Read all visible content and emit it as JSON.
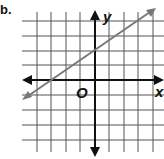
{
  "problem": {
    "number_label": "b."
  },
  "graph": {
    "x_axis_label": "x",
    "y_axis_label": "y",
    "origin_label": "O",
    "grid": {
      "x_range": [
        -5,
        4
      ],
      "y_range": [
        -4,
        4
      ],
      "spacing_px": 14.5
    },
    "line": {
      "description": "line with arrows through (-3, 0) and (0, 2)",
      "points": [
        [
          -3,
          0
        ],
        [
          0,
          2
        ]
      ],
      "slope": "2/3",
      "y_intercept": 2,
      "color": "#777777"
    }
  },
  "colors": {
    "grid": "#555555",
    "axes": "#111111",
    "line": "#777777",
    "background": "#ffffff"
  }
}
